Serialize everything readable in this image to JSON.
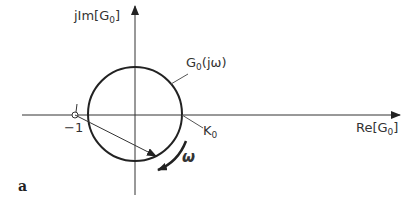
{
  "diagram": {
    "type": "nyquist-plot",
    "y_axis_label": {
      "prefix": "jIm[G",
      "sub": "0",
      "suffix": "]"
    },
    "x_axis_label": {
      "prefix": "Re[G",
      "sub": "0",
      "suffix": "]"
    },
    "curve_label": {
      "prefix": "G",
      "sub": "0",
      "suffix": "(jω)"
    },
    "critical_point_label": "−1",
    "intercept_label": {
      "prefix": "K",
      "sub": "0"
    },
    "direction_label": "ω",
    "figure_label": "a"
  }
}
